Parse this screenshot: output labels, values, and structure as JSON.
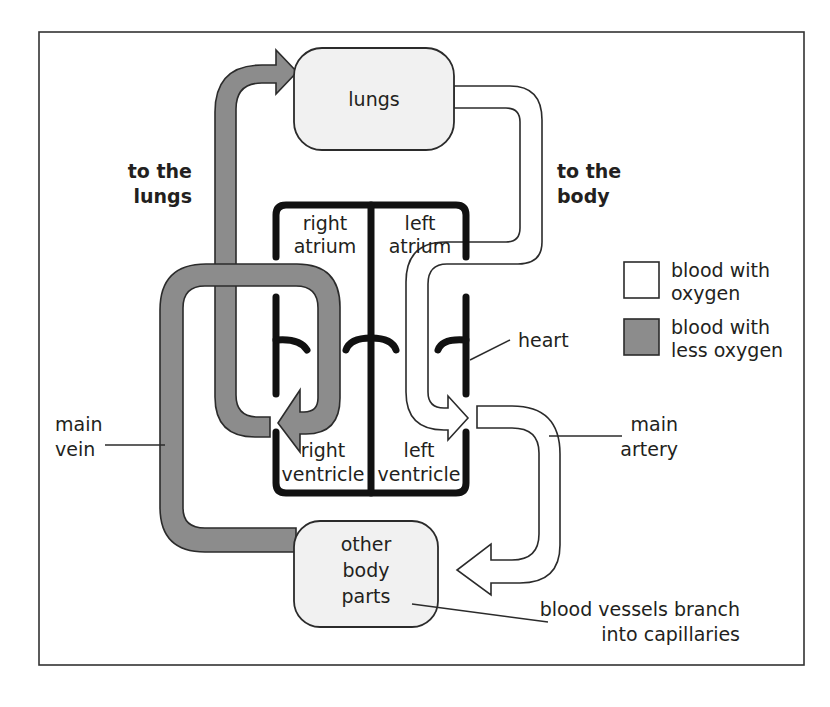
{
  "diagram": {
    "nodes": {
      "lungs": "lungs",
      "other_body_parts": [
        "other",
        "body",
        "parts"
      ],
      "heart_chambers": {
        "right_atrium": [
          "right",
          "atrium"
        ],
        "left_atrium": [
          "left",
          "atrium"
        ],
        "right_ventricle": [
          "right",
          "ventricle"
        ],
        "left_ventricle": [
          "left",
          "ventricle"
        ]
      }
    },
    "labels": {
      "to_the_lungs": [
        "to the",
        "lungs"
      ],
      "to_the_body": [
        "to the",
        "body"
      ],
      "heart": "heart",
      "main_vein": [
        "main",
        "vein"
      ],
      "main_artery": [
        "main",
        "artery"
      ],
      "capillaries": [
        "blood vessels branch",
        "into capillaries"
      ]
    },
    "legend": [
      {
        "swatch": "white",
        "color": "#ffffff",
        "label": [
          "blood with",
          "oxygen"
        ]
      },
      {
        "swatch": "grey",
        "color": "#8c8c8c",
        "label": [
          "blood with",
          "less oxygen"
        ]
      }
    ],
    "colors": {
      "oxygenated": "#ffffff",
      "deoxygenated": "#8c8c8c",
      "organ_fill": "#f1f1f1",
      "outline": "#2b2b2b"
    }
  }
}
